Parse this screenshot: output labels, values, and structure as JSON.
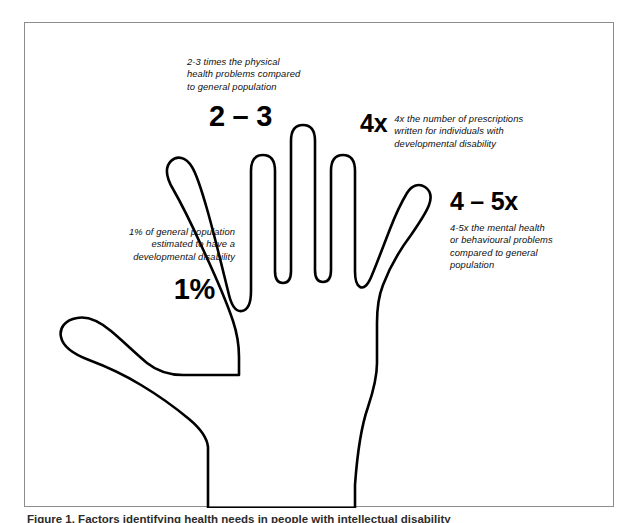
{
  "figure": {
    "border_color": "#8c8c8c",
    "background_color": "#ffffff",
    "ink_color": "#000000",
    "caption": "Figure 1. Factors identifying health needs in people with intellectual disability"
  },
  "callouts": {
    "physical_health": {
      "stat": "2 – 3",
      "body": "2-3 times the physical\nhealth problems compared\nto general population"
    },
    "prescriptions": {
      "stat": "4x",
      "body": "4x the number of prescriptions\nwritten for individuals with\ndevelopmental disability"
    },
    "mental_health": {
      "stat": "4 – 5x",
      "body": "4-5x the mental health\nor behavioural problems\ncompared to general\npopulation"
    },
    "prevalence": {
      "stat": "1%",
      "body": "1% of general population\nestimated to have a\ndevelopmental disability"
    }
  },
  "illustration": {
    "name": "open-hand-outline",
    "description": "Line-art outline of an open left hand with five extended fingers"
  }
}
